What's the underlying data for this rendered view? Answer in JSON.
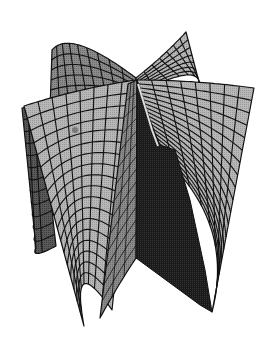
{
  "chart_data": {
    "type": "surface",
    "title": "",
    "xlabel": "",
    "ylabel": "",
    "zlabel": "",
    "axes_visible": false,
    "grid": true,
    "legend": null,
    "rendering": "monochrome halftone shading with black mesh lines",
    "sheets": [
      {
        "name": "back-left",
        "rows": 6,
        "cols": 9
      },
      {
        "name": "back-right",
        "rows": 7,
        "cols": 7
      },
      {
        "name": "left-curl",
        "rows": 12,
        "cols": 3
      },
      {
        "name": "front-left",
        "rows": 18,
        "cols": 8
      },
      {
        "name": "front-right",
        "rows": 18,
        "cols": 8
      },
      {
        "name": "inner-fold",
        "rows": 14,
        "cols": 3
      },
      {
        "name": "shadow-fold",
        "rows": 1,
        "cols": 1
      }
    ]
  },
  "colors": {
    "background": "#ffffff",
    "light": "#b8b8b8",
    "mid": "#8c8c8c",
    "dark": "#5a5a5a",
    "shadow": "#1a1a1a",
    "mesh": "#111111"
  }
}
